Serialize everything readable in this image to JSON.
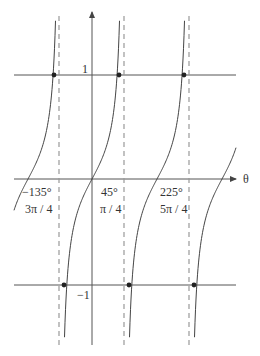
{
  "diagram": {
    "title": "",
    "axis_label_x": "θ",
    "y_tick_pos": "1",
    "y_tick_neg": "−1",
    "x_labels": [
      {
        "deg": "−135°",
        "rad": "3π / 4"
      },
      {
        "deg": "45°",
        "rad": "π / 4"
      },
      {
        "deg": "225°",
        "rad": "5π / 4"
      }
    ],
    "colors": {
      "curve": "#444444",
      "axis": "#555555",
      "asymptote": "#999999",
      "dot": "#222222"
    }
  },
  "chart_data": {
    "type": "line",
    "title": "",
    "xlabel": "θ",
    "ylabel": "",
    "x_tick_labels": [
      "−135° (3π / 4)",
      "45° (π / 4)",
      "225° (5π / 4)"
    ],
    "y_tick_labels": [
      "1",
      "−1"
    ],
    "asymptotes_deg": [
      -45,
      135,
      315
    ],
    "zero_crossings_deg": [
      -225,
      -45,
      135,
      315
    ],
    "horizontal_lines": [
      1,
      -1
    ],
    "grid": false
  }
}
